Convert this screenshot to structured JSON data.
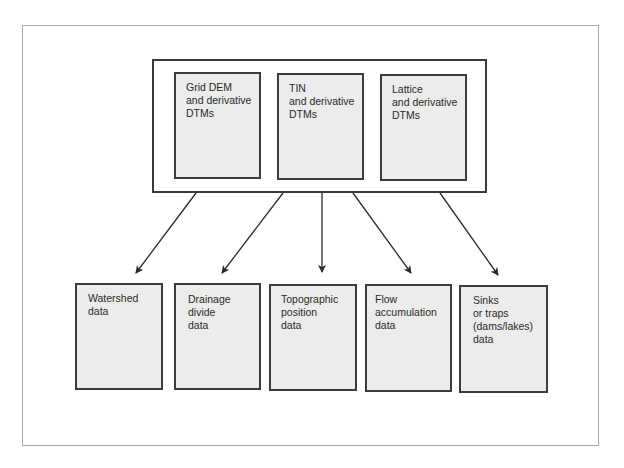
{
  "diagram": {
    "sources": [
      {
        "id": "grid-dem",
        "lines": [
          "Grid DEM",
          "and derivative",
          "DTMs"
        ]
      },
      {
        "id": "tin",
        "lines": [
          "TIN",
          "and derivative",
          "DTMs"
        ]
      },
      {
        "id": "lattice",
        "lines": [
          "Lattice",
          "and derivative",
          "DTMs"
        ]
      }
    ],
    "outputs": [
      {
        "id": "watershed",
        "lines": [
          "Watershed",
          "data"
        ]
      },
      {
        "id": "drainage-divide",
        "lines": [
          "Drainage",
          "divide",
          "data"
        ]
      },
      {
        "id": "topographic-position",
        "lines": [
          "Topographic",
          "position",
          "data"
        ]
      },
      {
        "id": "flow-accumulation",
        "lines": [
          "Flow",
          "accumulation",
          "data"
        ]
      },
      {
        "id": "sinks-traps",
        "lines": [
          "Sinks",
          "or traps",
          "(dams/lakes)",
          "data"
        ]
      }
    ],
    "colors": {
      "box_fill": "#ececec",
      "box_border": "#3c3c3c",
      "arrow": "#2a2a2a",
      "frame_border": "#a9a9a9"
    }
  }
}
